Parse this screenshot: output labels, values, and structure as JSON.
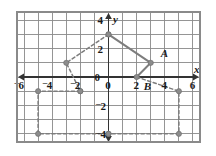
{
  "figure": {
    "kind": "coordinate-grid-plot",
    "background_color": "#ffffff",
    "grid_color": "#8a8a8a",
    "axis_color": "#333333",
    "shape_color": "#7d7d7d",
    "vertex_color": "#8c8c8c",
    "label_color": "#1a1a1a"
  },
  "axes": {
    "x_axis_name": "x",
    "y_axis_name": "y",
    "x_ticks": [
      {
        "value": -6,
        "label": "6",
        "negative": true
      },
      {
        "value": -4,
        "label": "4",
        "negative": true
      },
      {
        "value": -2,
        "label": "2",
        "negative": true
      },
      {
        "value": 0,
        "label": "0",
        "negative": false
      },
      {
        "value": 2,
        "label": "2",
        "negative": false
      },
      {
        "value": 4,
        "label": "4",
        "negative": false
      },
      {
        "value": 6,
        "label": "6",
        "negative": false
      }
    ],
    "y_ticks": [
      {
        "value": 4,
        "label": "4",
        "negative": false
      },
      {
        "value": 2,
        "label": "2",
        "negative": false
      },
      {
        "value": 0,
        "label": "0",
        "negative": false
      },
      {
        "value": -2,
        "label": "2",
        "negative": true
      },
      {
        "value": -4,
        "label": "4",
        "negative": true
      }
    ],
    "x_range": [
      -6.5,
      6.5
    ],
    "y_range": [
      -4.6,
      4.6
    ],
    "grid_step": 1,
    "grid_visible": true
  },
  "chart_data": {
    "type": "scatter",
    "title": "",
    "xlabel": "x",
    "ylabel": "y",
    "xlim": [
      -6.5,
      6.5
    ],
    "ylim": [
      -4.6,
      4.6
    ],
    "grid": true,
    "legend": "none",
    "series": [
      {
        "name": "preimage-solid",
        "style": "solid",
        "color": "#7d7d7d",
        "points": [
          {
            "x": 0,
            "y": 3,
            "label": ""
          },
          {
            "x": 3,
            "y": 1,
            "label": "A"
          },
          {
            "x": 2,
            "y": 0,
            "label": "B"
          }
        ],
        "path": [
          [
            0,
            3
          ],
          [
            3,
            1
          ],
          [
            2,
            0
          ]
        ]
      },
      {
        "name": "image-dashed-upper-left",
        "style": "dashed",
        "color": "#7d7d7d",
        "path": [
          [
            0,
            3
          ],
          [
            -3,
            1
          ],
          [
            -2,
            -1
          ]
        ],
        "points": [
          {
            "x": 0,
            "y": 3,
            "label": ""
          },
          {
            "x": -3,
            "y": 1,
            "label": ""
          },
          {
            "x": -2,
            "y": -1,
            "label": ""
          }
        ]
      },
      {
        "name": "image-dashed-lower-left",
        "style": "dashed",
        "color": "#7d7d7d",
        "path": [
          [
            -2,
            -1
          ],
          [
            -5,
            -1
          ],
          [
            -5,
            -4
          ],
          [
            0,
            -4
          ]
        ],
        "points": [
          {
            "x": -2,
            "y": -1,
            "label": ""
          },
          {
            "x": -5,
            "y": -1,
            "label": ""
          },
          {
            "x": -5,
            "y": -4,
            "label": ""
          },
          {
            "x": 0,
            "y": -4,
            "label": ""
          }
        ]
      },
      {
        "name": "image-dashed-lower-right",
        "style": "dashed",
        "color": "#7d7d7d",
        "path": [
          [
            2,
            0
          ],
          [
            5,
            -1
          ],
          [
            5,
            -4
          ],
          [
            0,
            -4
          ]
        ],
        "points": [
          {
            "x": 5,
            "y": -1,
            "label": ""
          },
          {
            "x": 5,
            "y": -4,
            "label": ""
          },
          {
            "x": 0,
            "y": -4,
            "label": ""
          }
        ]
      }
    ],
    "annotations": [
      {
        "text": "A",
        "x": 3,
        "y": 1,
        "dx": 10,
        "dy": -6
      },
      {
        "text": "B",
        "x": 2,
        "y": 0,
        "dx": 7,
        "dy": 13
      }
    ]
  },
  "point_labels": {
    "a": "A",
    "b": "B"
  }
}
